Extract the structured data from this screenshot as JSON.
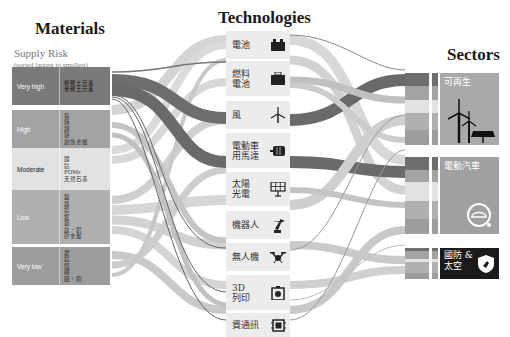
{
  "headings": {
    "materials": "Materials",
    "technologies": "Technologies",
    "sectors": "Sectors"
  },
  "materials": {
    "subtitle": "Supply Risk",
    "sort_note": "(sorted largest to smallest)",
    "levels": [
      {
        "label": "Very high",
        "elements": [
          "輕稀土元素",
          "重稀土元素"
        ],
        "color": "#7a7a7a"
      },
      {
        "label": "High",
        "elements": [
          "鎵",
          "鍺",
          "銦",
          "鉍",
          "鉑族金屬"
        ],
        "color": "#a3a3a3"
      },
      {
        "label": "Moderate",
        "elements": [
          "鋰",
          "鈷",
          "POMs",
          "天然石墨"
        ],
        "color": "#e2e2e2"
      },
      {
        "label": "Low",
        "elements": [
          "鎳",
          "鉻",
          "鎢",
          "鈮",
          "鉭",
          "鈦・鋁",
          "矽金屬"
        ],
        "color": "#b0b0b0"
      },
      {
        "label": "Very low",
        "elements": [
          "鍶",
          "錳",
          "鉬",
          "硼",
          "鐵・銅"
        ],
        "color": "#9d9d9d"
      }
    ]
  },
  "technologies": [
    {
      "label": "電池",
      "icon": "battery-icon"
    },
    {
      "label": "燃料\n電池",
      "icon": "fuel-cell-icon"
    },
    {
      "label": "風",
      "icon": "wind-turbine-icon"
    },
    {
      "label": "電動車\n用馬達",
      "icon": "motor-icon"
    },
    {
      "label": "太陽\n光電",
      "icon": "solar-panel-icon"
    },
    {
      "label": "機器人",
      "icon": "robot-arm-icon"
    },
    {
      "label": "無人機",
      "icon": "drone-icon"
    },
    {
      "label": "3D\n列印",
      "icon": "3d-printer-icon"
    },
    {
      "label": "資通訊",
      "icon": "chip-icon"
    }
  ],
  "sectors": [
    {
      "label": "可再生",
      "icon": "renewables-icon",
      "color": "#a9a9a9"
    },
    {
      "label": "電動汽車",
      "icon": "ev-car-icon",
      "color": "#a0a0a0"
    },
    {
      "label": "國防 &\n太空",
      "icon": "defense-shield-icon",
      "color": "#1a1a1a"
    }
  ]
}
